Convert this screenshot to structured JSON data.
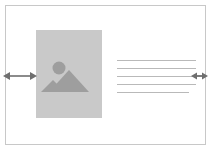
{
  "diagram": {
    "title": "Responsive image and text block resize diagram",
    "canvas": {
      "width": 213,
      "height": 152,
      "background_color": "#ffffff"
    },
    "frame": {
      "label": "Content container frame",
      "border_color": "#c8c8c8",
      "fill_color": "#ffffff",
      "x": 5,
      "y": 5,
      "width": 201,
      "height": 140
    },
    "image_placeholder": {
      "label": "Image placeholder",
      "icon": "mountain-photo-icon",
      "fill_color": "#c9c9c9",
      "icon_color": "#9e9e9e",
      "x": 36,
      "y": 30,
      "width": 66,
      "height": 88
    },
    "text_block": {
      "label": "Text lines",
      "line_color": "#b9b9b9",
      "line_count": 5,
      "lines": [
        {
          "width": 79
        },
        {
          "width": 79
        },
        {
          "width": 79
        },
        {
          "width": 79
        },
        {
          "width": 72
        }
      ],
      "x": 117,
      "y": 60
    },
    "handles": [
      {
        "name": "left-resize-arrow",
        "label": "Horizontal resize handle (wide)",
        "icon": "double-arrow-horizontal-icon",
        "color": "#6e6e6e",
        "x": 3,
        "y": 69,
        "width": 34,
        "height": 14
      },
      {
        "name": "right-resize-arrow",
        "label": "Horizontal resize handle (narrow)",
        "icon": "double-arrow-horizontal-icon",
        "color": "#6e6e6e",
        "x": 191,
        "y": 70,
        "width": 17,
        "height": 12
      }
    ]
  }
}
